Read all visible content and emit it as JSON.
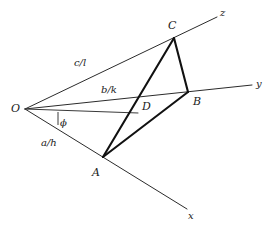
{
  "figure": {
    "kind": "geometry-diagram",
    "width": 269,
    "height": 227,
    "background_color": "#ffffff",
    "line_color": "#2b2b2b",
    "emphasis_color": "#111111"
  },
  "points": {
    "O": {
      "label": "O",
      "x": 25,
      "y": 109,
      "label_x": 11,
      "label_y": 112
    },
    "A": {
      "label": "A",
      "x": 103,
      "y": 157,
      "label_x": 92,
      "label_y": 176
    },
    "B": {
      "label": "B",
      "x": 188,
      "y": 92,
      "label_x": 193,
      "label_y": 105
    },
    "C": {
      "label": "C",
      "x": 174,
      "y": 38,
      "label_x": 168,
      "label_y": 29
    },
    "D": {
      "label": "D",
      "x": 138,
      "y": 113,
      "label_x": 142,
      "label_y": 110
    }
  },
  "axes": [
    {
      "name": "x-axis",
      "label": "x",
      "from_x": 25,
      "from_y": 109,
      "to_x": 187,
      "to_y": 209,
      "label_x": 188,
      "label_y": 219
    },
    {
      "name": "y-axis",
      "label": "y",
      "from_x": 25,
      "from_y": 109,
      "to_x": 252,
      "to_y": 85,
      "label_x": 256,
      "label_y": 87
    },
    {
      "name": "z-axis",
      "label": "z",
      "from_x": 25,
      "from_y": 109,
      "to_x": 217,
      "to_y": 17,
      "label_x": 220,
      "label_y": 16
    }
  ],
  "intercept_labels": [
    {
      "name": "x-intercept-ratio",
      "text": "a/h",
      "x": 41,
      "y": 146
    },
    {
      "name": "y-intercept-ratio",
      "text": "b/k",
      "x": 101,
      "y": 93
    },
    {
      "name": "z-intercept-ratio",
      "text": "c/l",
      "x": 74,
      "y": 66
    }
  ],
  "angle": {
    "name": "phi-angle",
    "symbol": "ϕ",
    "label_x": 60,
    "label_y": 126,
    "reference_line": {
      "from_x": 25,
      "from_y": 109,
      "to_x": 138,
      "to_y": 113
    },
    "tick": {
      "x": 58,
      "y_top": 112,
      "y_bottom": 125
    }
  },
  "triangle": {
    "name": "triangle-ABC",
    "vertices": [
      "A",
      "B",
      "C"
    ],
    "edges": [
      {
        "name": "edge-A-C",
        "from": "A",
        "to": "C"
      },
      {
        "name": "edge-C-B",
        "from": "C",
        "to": "B"
      },
      {
        "name": "edge-B-A",
        "from": "B",
        "to": "A"
      }
    ]
  }
}
